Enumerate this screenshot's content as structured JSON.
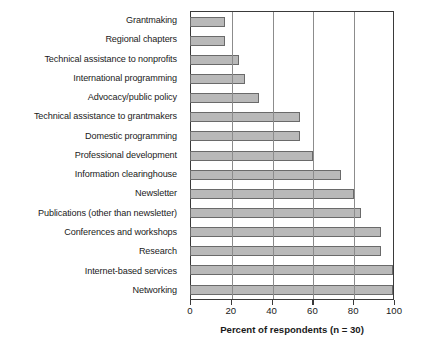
{
  "chart_data": {
    "type": "bar",
    "orientation": "horizontal",
    "title": "",
    "xlabel": "Percent of respondents (n = 30)",
    "ylabel": "",
    "xlim": [
      0,
      100
    ],
    "xticks": [
      0,
      20,
      40,
      60,
      80,
      100
    ],
    "xtick_labels": [
      "0",
      "20",
      "40",
      "60",
      "80",
      "100"
    ],
    "grid": "vertical",
    "legend": null,
    "bar_fill_color": "#b9b9b9",
    "bar_edge_color": "#6a6a6a",
    "axis_color": "#3a3a3a",
    "gridline_color": "#8c8c8c",
    "categories": [
      "Grantmaking",
      "Regional chapters",
      "Technical assistance to nonprofits",
      "International programming",
      "Advocacy/public policy",
      "Technical assistance to grantmakers",
      "Domestic programming",
      "Professional development",
      "Information clearinghouse",
      "Newsletter",
      "Publications (other than newsletter)",
      "Conferences and workshops",
      "Research",
      "Internet-based services",
      "Networking"
    ],
    "values": [
      16.7,
      16.7,
      23.3,
      26.7,
      33.3,
      53.3,
      53.3,
      60.0,
      73.3,
      80.0,
      83.3,
      93.3,
      93.3,
      100.0,
      100.0
    ]
  }
}
